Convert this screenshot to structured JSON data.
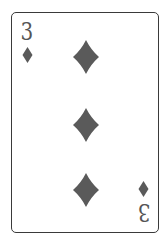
{
  "card": {
    "rank": "3",
    "suit": "diamonds",
    "suit_icon": "diamond-icon",
    "pip_count": 3,
    "colors": {
      "pip": "#5a5a5a",
      "border": "#3a3a3a",
      "background": "#ffffff"
    }
  }
}
